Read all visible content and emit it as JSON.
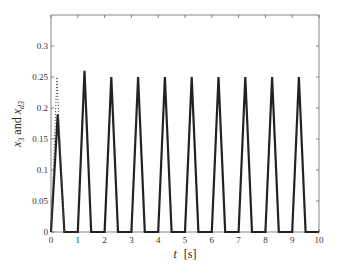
{
  "chart_data": {
    "type": "line",
    "title": "",
    "xlabel": "t [s]",
    "xlabel_parts": {
      "var": "t",
      "unit": "[s]"
    },
    "ylabel": "x3 and xd3",
    "ylabel_parts": {
      "a": "x",
      "a_sub": "3",
      "mid": " and ",
      "b": "x",
      "b_sub": "d3"
    },
    "xlim": [
      0,
      10
    ],
    "ylim": [
      0,
      0.35
    ],
    "xticks": [
      0,
      1,
      2,
      3,
      4,
      5,
      6,
      7,
      8,
      9,
      10
    ],
    "xtick_labels": [
      "0",
      "1",
      "2",
      "3",
      "4",
      "5",
      "6",
      "7",
      "8",
      "9",
      "10"
    ],
    "yticks": [
      0,
      0.05,
      0.1,
      0.15,
      0.2,
      0.25,
      0.3
    ],
    "ytick_labels": [
      "0",
      "0.05",
      "0.1",
      "0.15",
      "0.2",
      "0.25",
      "0.3"
    ],
    "grid": false,
    "legend": null,
    "series": [
      {
        "name": "x3",
        "style": "solid",
        "color": "#222222",
        "x": [
          0,
          0.25,
          0.5,
          1.0,
          1.25,
          1.5,
          2.0,
          2.25,
          2.5,
          3.0,
          3.25,
          3.5,
          4.0,
          4.25,
          4.5,
          5.0,
          5.25,
          5.5,
          6.0,
          6.25,
          6.5,
          7.0,
          7.25,
          7.5,
          8.0,
          8.25,
          8.5,
          9.0,
          9.25,
          9.5,
          10.0
        ],
        "y": [
          0,
          0.19,
          0,
          0,
          0.26,
          0,
          0,
          0.25,
          0,
          0,
          0.25,
          0,
          0,
          0.25,
          0,
          0,
          0.25,
          0,
          0,
          0.25,
          0,
          0,
          0.25,
          0,
          0,
          0.25,
          0,
          0,
          0.25,
          0,
          0
        ]
      },
      {
        "name": "xd3",
        "style": "dotted",
        "color": "#555555",
        "x": [
          0,
          0.22,
          0.5
        ],
        "y": [
          0,
          0.25,
          0
        ]
      }
    ]
  }
}
